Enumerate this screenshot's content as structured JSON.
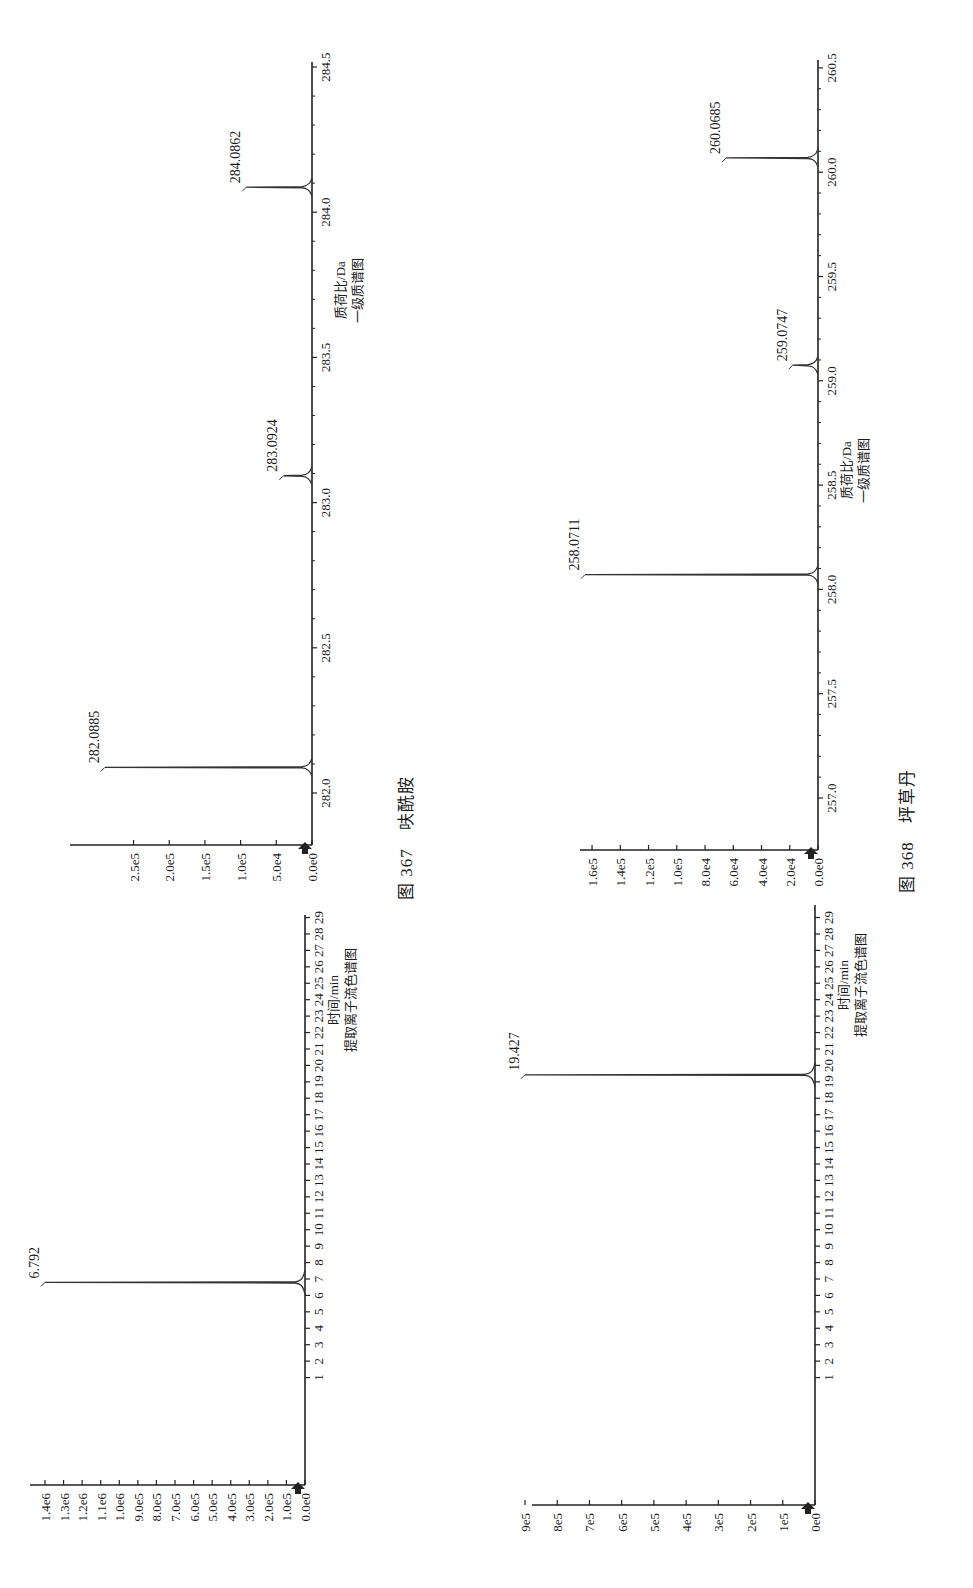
{
  "page": {
    "orientation": "rotated-90-ccw",
    "figures": [
      {
        "number": "图 367",
        "compound": "呋酰胺",
        "caption": "图 367　呋酰胺"
      },
      {
        "number": "图 368",
        "compound": "坪草丹",
        "caption": "图 368　坪草丹"
      }
    ]
  },
  "chart_data": [
    {
      "id": "fig367-xic",
      "figure": "图 367",
      "type": "line",
      "title": "提取离子流色谱图",
      "xlabel": "时间/min",
      "ylabel": "",
      "xlim": [
        0,
        29.5
      ],
      "ylim": [
        0,
        1400000
      ],
      "x_ticks": [
        "1",
        "2",
        "3",
        "4",
        "5",
        "6",
        "7",
        "8",
        "9",
        "10",
        "11",
        "12",
        "13",
        "14",
        "15",
        "16",
        "17",
        "18",
        "19",
        "20",
        "21",
        "22",
        "23",
        "24",
        "25",
        "26",
        "27",
        "28",
        "29"
      ],
      "y_ticks": [
        "0.0e0",
        "1.0e5",
        "2.0e5",
        "3.0e5",
        "4.0e5",
        "5.0e5",
        "6.0e5",
        "7.0e5",
        "8.0e5",
        "9.0e5",
        "1.0e6",
        "1.1e6",
        "1.2e6",
        "1.3e6",
        "1.4e6"
      ],
      "grid": false,
      "peaks": [
        {
          "x": 6.792,
          "y": 1400000,
          "label": "6.792"
        }
      ]
    },
    {
      "id": "fig367-ms1",
      "figure": "图 367",
      "type": "bar",
      "title": "一级质谱图",
      "xlabel": "质荷比/Da",
      "ylabel": "",
      "xlim": [
        281.85,
        284.6
      ],
      "ylim": [
        0,
        290000
      ],
      "x_ticks": [
        "282.0",
        "282.5",
        "283.0",
        "283.5",
        "284.0",
        "284.5"
      ],
      "y_ticks": [
        "0.0e0",
        "5.0e4",
        "1.0e5",
        "1.5e5",
        "2.0e5",
        "2.5e5"
      ],
      "grid": false,
      "peaks": [
        {
          "x": 282.0885,
          "y": 290000,
          "label": "282.0885"
        },
        {
          "x": 283.0924,
          "y": 40000,
          "label": "283.0924"
        },
        {
          "x": 284.0862,
          "y": 92000,
          "label": "284.0862"
        }
      ]
    },
    {
      "id": "fig368-xic",
      "figure": "图 368",
      "type": "line",
      "title": "提取离子流色谱图",
      "xlabel": "时间/min",
      "ylabel": "",
      "xlim": [
        0,
        29.5
      ],
      "ylim": [
        0,
        900000
      ],
      "x_ticks": [
        "1",
        "2",
        "3",
        "4",
        "5",
        "6",
        "7",
        "8",
        "9",
        "10",
        "11",
        "12",
        "13",
        "14",
        "15",
        "16",
        "17",
        "18",
        "19",
        "20",
        "21",
        "22",
        "23",
        "24",
        "25",
        "26",
        "27",
        "28",
        "29"
      ],
      "y_ticks": [
        "0e0",
        "1e5",
        "2e5",
        "3e5",
        "4e5",
        "5e5",
        "6e5",
        "7e5",
        "8e5",
        "9e5"
      ],
      "grid": false,
      "peaks": [
        {
          "x": 19.427,
          "y": 900000,
          "label": "19.427"
        }
      ]
    },
    {
      "id": "fig368-ms1",
      "figure": "图 368",
      "type": "bar",
      "title": "一级质谱图",
      "xlabel": "质荷比/Da",
      "ylabel": "",
      "xlim": [
        256.75,
        260.6
      ],
      "ylim": [
        0,
        165000
      ],
      "x_ticks": [
        "257.0",
        "257.5",
        "258.0",
        "258.5",
        "259.0",
        "259.5",
        "260.0",
        "260.5"
      ],
      "y_ticks": [
        "0.0e0",
        "2.0e4",
        "4.0e4",
        "6.0e4",
        "8.0e4",
        "1.0e5",
        "1.2e5",
        "1.4e5",
        "1.6e5"
      ],
      "grid": false,
      "peaks": [
        {
          "x": 258.0711,
          "y": 165000,
          "label": "258.0711"
        },
        {
          "x": 259.0747,
          "y": 18000,
          "label": "259.0747"
        },
        {
          "x": 260.0685,
          "y": 65000,
          "label": "260.0685"
        }
      ]
    }
  ]
}
